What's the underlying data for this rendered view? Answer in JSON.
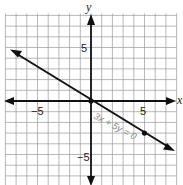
{
  "chart_data": {
    "type": "line",
    "title": "",
    "xlabel": "x",
    "ylabel": "y",
    "xlim": [
      -8,
      8
    ],
    "ylim": [
      -8,
      8
    ],
    "grid": true,
    "x_ticks_labeled": [
      -5,
      5
    ],
    "y_ticks_labeled": [
      5,
      -5
    ],
    "x_tick_labels": [
      "−5",
      "5"
    ],
    "y_tick_labels": [
      "5",
      "−5"
    ],
    "series": [
      {
        "name": "3x + 5y = 0",
        "equation": "3x + 5y = 0",
        "x": [
          -8,
          0,
          5,
          8
        ],
        "y": [
          4.8,
          0,
          -3,
          -4.8
        ],
        "arrows": "both"
      }
    ],
    "points": [
      {
        "x": 0,
        "y": 0
      },
      {
        "x": 5,
        "y": -3
      }
    ],
    "annotations": [
      {
        "text": "3x + 5y = 0",
        "x": 4,
        "y": -2
      }
    ]
  },
  "labels": {
    "x_axis": "x",
    "y_axis": "y",
    "x_neg": "−5",
    "x_pos": "5",
    "y_pos": "5",
    "y_neg": "−5",
    "equation": "3x + 5y = 0"
  }
}
